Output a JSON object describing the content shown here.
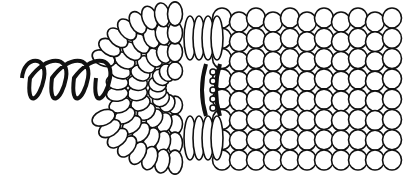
{
  "illustration": {
    "subject": "corn cob with coiled spring",
    "colors": {
      "background": "#ffffff",
      "ink": "#111111",
      "kernel": "#ffffff"
    },
    "spring": {
      "coils": 4,
      "x_start": 20,
      "x_end": 118,
      "y_center": 78
    },
    "cob": {
      "x_start": 98,
      "x_end": 398,
      "y_top": 12,
      "y_bottom": 162
    },
    "clip": {
      "x": 212,
      "y_top": 62,
      "y_bottom": 118
    }
  }
}
